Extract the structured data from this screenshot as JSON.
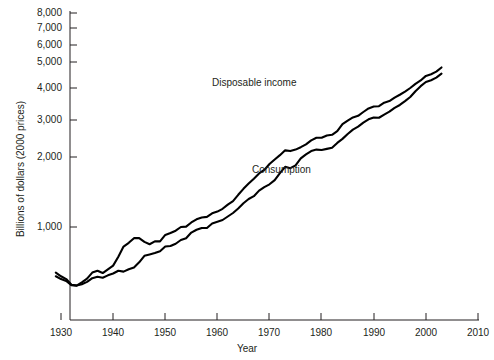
{
  "figure": {
    "background_color": "#ffffff",
    "line_color": "#000000"
  },
  "axes": {
    "y_axis_title": "Billions of dollars (2000 prices)",
    "x_axis_title": "Year",
    "y_tick_labels": [
      "8,000",
      "7,000",
      "6,000",
      "5,000",
      "4,000",
      "3,000",
      "2,000",
      "1,000"
    ],
    "x_tick_labels": [
      "1930",
      "1940",
      "1950",
      "1960",
      "1970",
      "1980",
      "1990",
      "2000",
      "2010"
    ]
  },
  "series_labels": {
    "disposable_income": "Disposable income",
    "consumption": "Consumption"
  },
  "chart_data": {
    "type": "line",
    "title": "",
    "subtitle": "",
    "xlabel": "Year",
    "ylabel": "Billions of dollars (2000 prices)",
    "xlim": [
      1930,
      2010
    ],
    "ylim": [
      0,
      8000
    ],
    "xticks": [
      1930,
      1940,
      1950,
      1960,
      1970,
      1980,
      1990,
      2000,
      2010
    ],
    "yticks": [
      1000,
      2000,
      3000,
      4000,
      5000,
      6000,
      7000,
      8000
    ],
    "grid": false,
    "legend": "inline-annotations",
    "legend_position": "inline",
    "annotations": [
      {
        "text": "Disposable income",
        "x": 1963,
        "y": 3950
      },
      {
        "text": "Consumption",
        "x": 1971,
        "y": 2150
      }
    ],
    "x": [
      1929,
      1930,
      1931,
      1932,
      1933,
      1934,
      1935,
      1936,
      1937,
      1938,
      1939,
      1940,
      1941,
      1942,
      1943,
      1944,
      1945,
      1946,
      1947,
      1948,
      1949,
      1950,
      1951,
      1952,
      1953,
      1954,
      1955,
      1956,
      1957,
      1958,
      1959,
      1960,
      1961,
      1962,
      1963,
      1964,
      1965,
      1966,
      1967,
      1968,
      1969,
      1970,
      1971,
      1972,
      1973,
      1974,
      1975,
      1976,
      1977,
      1978,
      1979,
      1980,
      1981,
      1982,
      1983,
      1984,
      1985,
      1986,
      1987,
      1988,
      1989,
      1990,
      1991,
      1992,
      1993,
      1994,
      1995,
      1996,
      1997,
      1998,
      1999,
      2000,
      2001,
      2002,
      2003
    ],
    "series": [
      {
        "name": "Disposable income",
        "values": [
          510,
          470,
          440,
          380,
          370,
          405,
          445,
          510,
          530,
          505,
          545,
          585,
          680,
          790,
          830,
          880,
          880,
          840,
          815,
          845,
          845,
          915,
          935,
          960,
          1000,
          1005,
          1065,
          1110,
          1135,
          1145,
          1195,
          1220,
          1260,
          1320,
          1370,
          1460,
          1545,
          1620,
          1690,
          1765,
          1815,
          1900,
          1965,
          2050,
          2180,
          2160,
          2200,
          2265,
          2340,
          2450,
          2520,
          2520,
          2580,
          2600,
          2700,
          2890,
          2985,
          3080,
          3130,
          3250,
          3360,
          3420,
          3430,
          3540,
          3590,
          3700,
          3790,
          3885,
          4000,
          4160,
          4290,
          4465,
          4530,
          4630,
          4790
        ]
      },
      {
        "name": "Consumption",
        "values": [
          470,
          440,
          420,
          375,
          370,
          385,
          410,
          450,
          465,
          455,
          480,
          500,
          530,
          520,
          545,
          565,
          620,
          690,
          705,
          720,
          740,
          790,
          795,
          820,
          860,
          880,
          940,
          970,
          990,
          990,
          1050,
          1075,
          1100,
          1150,
          1200,
          1265,
          1340,
          1400,
          1440,
          1520,
          1570,
          1610,
          1670,
          1770,
          1860,
          1840,
          1880,
          1980,
          2070,
          2160,
          2200,
          2190,
          2220,
          2250,
          2380,
          2490,
          2620,
          2740,
          2820,
          2930,
          3020,
          3080,
          3070,
          3170,
          3260,
          3380,
          3470,
          3590,
          3720,
          3900,
          4070,
          4230,
          4300,
          4400,
          4550
        ]
      }
    ]
  }
}
